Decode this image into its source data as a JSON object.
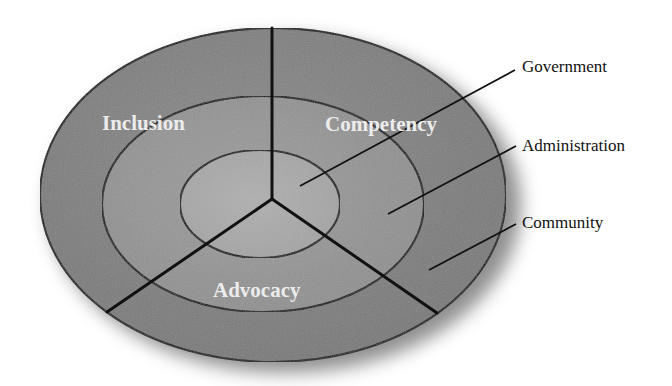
{
  "diagram": {
    "type": "concentric-ellipse-sector-diagram",
    "colors": {
      "outer_ring": "#7f7f7f",
      "middle_ring": "#959595",
      "inner_core": "#a9a9a9",
      "lines": "#111111",
      "sector_text": "#ececec",
      "ring_text": "#111111",
      "shadow": "#6a6a6a"
    },
    "rings": [
      {
        "name": "Government",
        "level": "inner"
      },
      {
        "name": "Administration",
        "level": "middle"
      },
      {
        "name": "Community",
        "level": "outer"
      }
    ],
    "sectors": [
      {
        "name": "Inclusion",
        "position": "upper-left"
      },
      {
        "name": "Competency",
        "position": "upper-right"
      },
      {
        "name": "Advocacy",
        "position": "bottom"
      }
    ],
    "labels": {
      "government": "Government",
      "administration": "Administration",
      "community": "Community",
      "inclusion": "Inclusion",
      "competency": "Competency",
      "advocacy": "Advocacy"
    }
  }
}
